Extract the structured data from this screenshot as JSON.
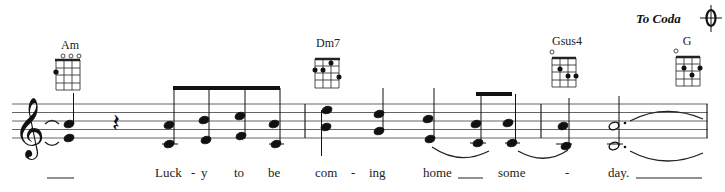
{
  "score": {
    "coda_marking": {
      "label": "To Coda",
      "icon": "coda-icon"
    },
    "chords": [
      {
        "name": "Am",
        "x": 70,
        "open_strings": [
          2,
          3,
          4
        ],
        "dots": [
          {
            "string": 1,
            "fret": 2
          }
        ]
      },
      {
        "name": "Dm7",
        "x": 328,
        "open_strings": [],
        "barre_top": true,
        "dots": [
          {
            "string": 1,
            "fret": 2
          },
          {
            "string": 2,
            "fret": 2
          },
          {
            "string": 3,
            "fret": 1
          },
          {
            "string": 4,
            "fret": 3
          }
        ]
      },
      {
        "name": "Gsus4",
        "x": 567,
        "open_strings": [
          1
        ],
        "dots": [
          {
            "string": 2,
            "fret": 2
          },
          {
            "string": 3,
            "fret": 3
          },
          {
            "string": 4,
            "fret": 3
          }
        ]
      },
      {
        "name": "G",
        "x": 688,
        "open_strings": [
          1
        ],
        "dots": [
          {
            "string": 2,
            "fret": 2
          },
          {
            "string": 3,
            "fret": 3
          },
          {
            "string": 4,
            "fret": 2
          }
        ]
      }
    ],
    "clef": "treble",
    "lyrics": [
      {
        "text": "____",
        "x": 46
      },
      {
        "text": "Luck",
        "x": 155
      },
      {
        "text": "-",
        "x": 191
      },
      {
        "text": "y",
        "x": 202
      },
      {
        "text": "to",
        "x": 235
      },
      {
        "text": "be",
        "x": 268
      },
      {
        "text": "com",
        "x": 316
      },
      {
        "text": "-",
        "x": 351
      },
      {
        "text": "ing",
        "x": 369
      },
      {
        "text": "home",
        "x": 423
      },
      {
        "text": "____",
        "x": 458
      },
      {
        "text": "some",
        "x": 498
      },
      {
        "text": "-",
        "x": 565
      },
      {
        "text": "day.",
        "x": 609
      },
      {
        "text": "_________",
        "x": 636
      }
    ]
  }
}
